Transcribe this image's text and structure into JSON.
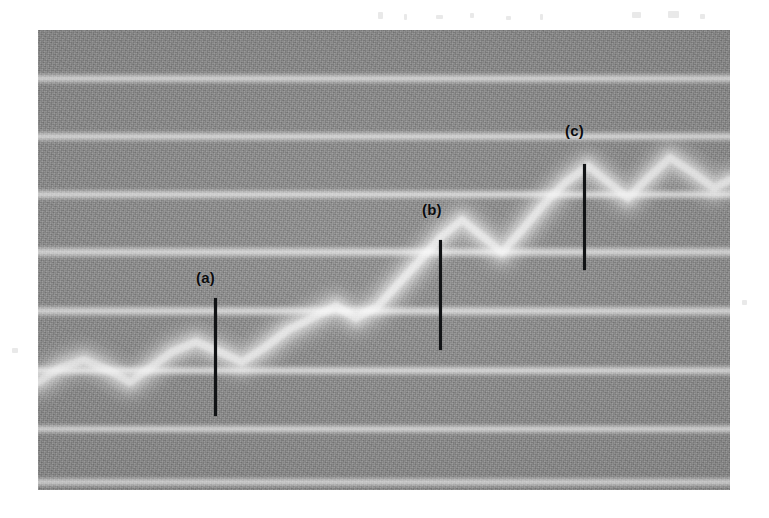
{
  "figure": {
    "kind": "grayscale-scan",
    "panel": {
      "x": 38,
      "y": 30,
      "width": 692,
      "height": 460
    },
    "background_color": "#8c8c8c",
    "band_color": "#ffffff",
    "marker_color": "#111315",
    "bands": [
      {
        "y": 48,
        "thickness": 13
      },
      {
        "y": 106,
        "thickness": 13
      },
      {
        "y": 164,
        "thickness": 13
      },
      {
        "y": 222,
        "thickness": 14
      },
      {
        "y": 281,
        "thickness": 14
      },
      {
        "y": 340,
        "thickness": 13
      },
      {
        "y": 399,
        "thickness": 12
      },
      {
        "y": 452,
        "thickness": 12
      }
    ],
    "streak": {
      "description": "ascending sawtooth bright streak",
      "points": [
        [
          0,
          352
        ],
        [
          22,
          338
        ],
        [
          46,
          330
        ],
        [
          70,
          340
        ],
        [
          92,
          352
        ],
        [
          112,
          338
        ],
        [
          134,
          322
        ],
        [
          158,
          312
        ],
        [
          182,
          322
        ],
        [
          204,
          332
        ],
        [
          226,
          318
        ],
        [
          250,
          300
        ],
        [
          274,
          288
        ],
        [
          298,
          276
        ],
        [
          318,
          288
        ],
        [
          340,
          276
        ],
        [
          362,
          252
        ],
        [
          384,
          228
        ],
        [
          404,
          206
        ],
        [
          424,
          190
        ],
        [
          444,
          206
        ],
        [
          464,
          222
        ],
        [
          484,
          200
        ],
        [
          506,
          174
        ],
        [
          528,
          152
        ],
        [
          550,
          136
        ],
        [
          570,
          152
        ],
        [
          590,
          168
        ],
        [
          610,
          148
        ],
        [
          632,
          128
        ],
        [
          654,
          142
        ],
        [
          676,
          158
        ],
        [
          692,
          150
        ]
      ]
    },
    "markers": [
      {
        "id": "a",
        "label": "(a)",
        "label_x": 158,
        "label_y": 240,
        "line_x": 176,
        "line_top": 268,
        "line_bottom": 386
      },
      {
        "id": "b",
        "label": "(b)",
        "label_x": 384,
        "label_y": 172,
        "line_x": 401,
        "line_top": 210,
        "line_bottom": 320
      },
      {
        "id": "c",
        "label": "(c)",
        "label_x": 527,
        "label_y": 93,
        "line_x": 545,
        "line_top": 134,
        "line_bottom": 240
      }
    ],
    "scan_specks": [
      {
        "x": 378,
        "y": 12,
        "w": 5,
        "h": 7
      },
      {
        "x": 404,
        "y": 14,
        "w": 3,
        "h": 6
      },
      {
        "x": 436,
        "y": 15,
        "w": 7,
        "h": 4
      },
      {
        "x": 470,
        "y": 13,
        "w": 4,
        "h": 5
      },
      {
        "x": 506,
        "y": 16,
        "w": 5,
        "h": 4
      },
      {
        "x": 540,
        "y": 14,
        "w": 3,
        "h": 6
      },
      {
        "x": 632,
        "y": 12,
        "w": 9,
        "h": 6
      },
      {
        "x": 668,
        "y": 11,
        "w": 11,
        "h": 7
      },
      {
        "x": 700,
        "y": 14,
        "w": 5,
        "h": 5
      },
      {
        "x": 12,
        "y": 348,
        "w": 6,
        "h": 5
      },
      {
        "x": 742,
        "y": 300,
        "w": 5,
        "h": 5
      }
    ]
  }
}
